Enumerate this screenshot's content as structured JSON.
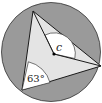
{
  "diagram": {
    "type": "inscribed-angle-figure",
    "labels": {
      "central_angle": "c",
      "inscribed_angle": "63°"
    },
    "colors": {
      "circle_fill": "#9a9a9a",
      "triangle_fill": "#e4e4e4",
      "angle_sector_fill": "#ffffff",
      "stroke": "#1a1a1a"
    }
  }
}
